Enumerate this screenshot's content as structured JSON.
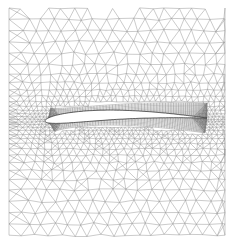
{
  "figure": {
    "elements": {
      "far_field": "unstructured triangular mesh",
      "near_wall": "structured quadrilateral O-grid boundary layer",
      "body": "airfoil (cambered, blunt leading edge, sharp trailing edge)"
    },
    "colors": {
      "background": "#ffffff",
      "mesh_line": "#8a8a8a",
      "dense_mesh_line": "#6e6e6e",
      "airfoil_fill": "#ffffff",
      "airfoil_outline": "#444444"
    }
  }
}
